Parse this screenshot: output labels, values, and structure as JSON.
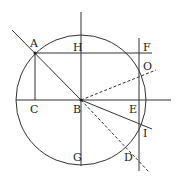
{
  "diagram": {
    "type": "geometry",
    "stroke_color": "#333333",
    "circle": {
      "cx": 81,
      "cy": 100,
      "r": 65
    },
    "points": {
      "A": {
        "label": "A",
        "x": 35,
        "y": 53,
        "lx": 30,
        "ly": 47
      },
      "H": {
        "label": "H",
        "x": 81,
        "y": 53,
        "lx": 73,
        "ly": 51
      },
      "F": {
        "label": "F",
        "x": 139,
        "y": 53,
        "lx": 143,
        "ly": 51
      },
      "O": {
        "label": "O",
        "x": 139,
        "y": 77,
        "lx": 143,
        "ly": 70
      },
      "C": {
        "label": "C",
        "x": 35,
        "y": 100,
        "lx": 30,
        "ly": 113
      },
      "B": {
        "label": "B",
        "x": 81,
        "y": 100,
        "lx": 73,
        "ly": 113
      },
      "E": {
        "label": "E",
        "x": 139,
        "y": 100,
        "lx": 129,
        "ly": 113
      },
      "I": {
        "label": "I",
        "x": 139,
        "y": 124,
        "lx": 143,
        "ly": 137
      },
      "G": {
        "label": "G",
        "x": 81,
        "y": 166,
        "lx": 73,
        "ly": 161
      },
      "D": {
        "label": "D",
        "x": 125,
        "y": 146,
        "lx": 124,
        "ly": 161
      }
    },
    "labels": [
      "A",
      "H",
      "F",
      "O",
      "C",
      "B",
      "E",
      "I",
      "G",
      "D"
    ]
  }
}
